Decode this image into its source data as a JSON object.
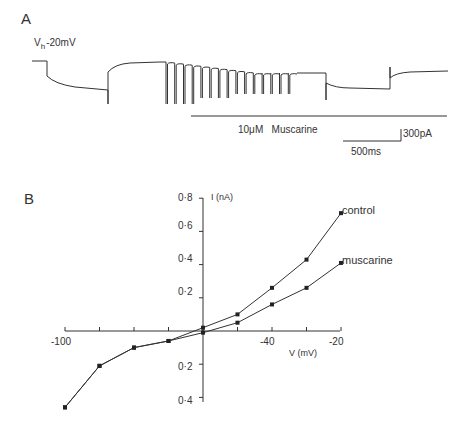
{
  "panel_a": {
    "label": "A",
    "holding_label_v": "V",
    "holding_label_sub": "h",
    "holding_label_value": "-20mV",
    "drug_bar_label": "10μM   Muscarine",
    "scale_current": "300pA",
    "scale_time": "500ms"
  },
  "panel_b": {
    "label": "B",
    "y_axis_label": "I (nA)",
    "x_axis_label": "V (mV)",
    "y_ticks_pos": [
      "0·8",
      "0·6",
      "0·4",
      "0·2"
    ],
    "y_ticks_neg": [
      "0·2",
      "0·4"
    ],
    "x_tick_labels": [
      "-100",
      "-40",
      "-20"
    ],
    "legend": {
      "control": "control",
      "muscarine": "muscarine"
    }
  },
  "chart_data": [
    {
      "type": "line",
      "title": "A: Membrane current trace, holding potential -20mV, 10μM Muscarine application",
      "annotations": [
        "Vh -20mV",
        "10μM Muscarine",
        "300pA",
        "500ms"
      ],
      "description": "Current trace with hyperpolarizing steps; repeated downward deflections during muscarine application"
    },
    {
      "type": "line",
      "title": "B: Current-voltage relation",
      "xlabel": "V (mV)",
      "ylabel": "I (nA)",
      "xlim": [
        -100,
        -20
      ],
      "ylim": [
        -0.4,
        0.8
      ],
      "x_ticks": [
        -100,
        -90,
        -80,
        -70,
        -60,
        -50,
        -40,
        -30,
        -20
      ],
      "x_tick_labels_shown": [
        "-100",
        "-40",
        "-20"
      ],
      "y_ticks": [
        -0.4,
        -0.2,
        0.2,
        0.4,
        0.6,
        0.8
      ],
      "grid": false,
      "legend_position": "inline-right",
      "x": [
        -100,
        -90,
        -80,
        -70,
        -60,
        -50,
        -40,
        -30,
        -20
      ],
      "series": [
        {
          "name": "control",
          "values": [
            -0.46,
            -0.21,
            -0.1,
            -0.06,
            0.02,
            0.1,
            0.26,
            0.43,
            0.71
          ]
        },
        {
          "name": "muscarine",
          "values": [
            -0.46,
            -0.21,
            -0.1,
            -0.06,
            -0.01,
            0.05,
            0.16,
            0.26,
            0.41
          ]
        }
      ]
    }
  ]
}
